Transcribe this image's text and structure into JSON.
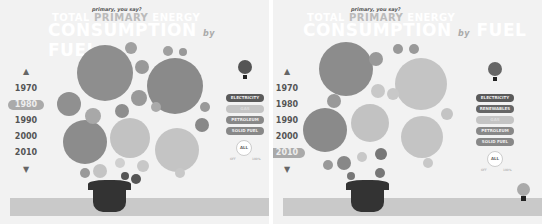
{
  "colors": {
    "background": "#f2f2f2",
    "dark": "#5a5a5a",
    "mid": "#888888",
    "light": "#c4c4c4",
    "pot": "#333333"
  },
  "panels": [
    {
      "subtitle": "primary, you say?",
      "title_line1_a": "TOTAL",
      "title_line1_b": "PRIMARY",
      "title_line1_c": "ENERGY",
      "title_line2": "CONSUMPTION",
      "title_of": "by",
      "title_fuel": "FUEL",
      "years": [
        "1970",
        "1980",
        "1990",
        "2000",
        "2010"
      ],
      "selected_year": "1980",
      "up_icon": "▲",
      "down_icon": "▼",
      "fuel_buttons": [
        {
          "label": "ELECTRICITY",
          "style": "dark"
        },
        {
          "label": "GAS",
          "style": "light"
        },
        {
          "label": "PETROLEUM",
          "style": "mid"
        },
        {
          "label": "SOLID FUEL",
          "style": "mid"
        }
      ],
      "dial": {
        "label": "ALL",
        "min": "OFF",
        "max": "100%"
      }
    },
    {
      "subtitle": "primary, you say?",
      "title_line1_a": "TOTAL",
      "title_line1_b": "PRIMARY",
      "title_line1_c": "ENERGY",
      "title_line2": "CONSUMPTION",
      "title_of": "by",
      "title_fuel": "FUEL",
      "years": [
        "1970",
        "1980",
        "1990",
        "2000",
        "2010"
      ],
      "selected_year": "2010",
      "up_icon": "▲",
      "down_icon": "▼",
      "fuel_buttons": [
        {
          "label": "ELECTRICITY",
          "style": "dark"
        },
        {
          "label": "RENEWABLES",
          "style": "dark"
        },
        {
          "label": "GAS",
          "style": "light"
        },
        {
          "label": "PETROLEUM",
          "style": "mid"
        },
        {
          "label": "SOLID FUEL",
          "style": "mid"
        }
      ],
      "dial": {
        "label": "ALL",
        "min": "OFF",
        "max": "100%"
      }
    }
  ]
}
